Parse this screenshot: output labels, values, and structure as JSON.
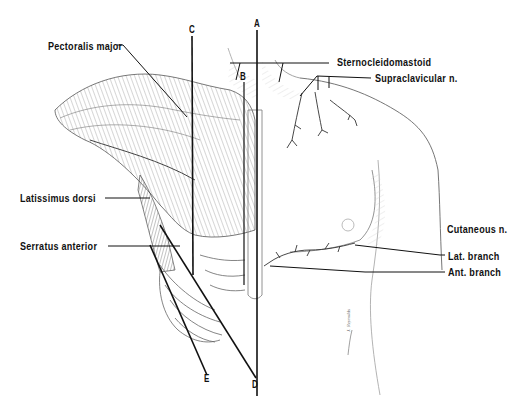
{
  "figure": {
    "background": "#ffffff",
    "ink_color": "#111111",
    "shading_color": "#9a9a9a"
  },
  "labels": {
    "pectoralis_major": "Pectoralis major",
    "latissimus_dorsi": "Latissimus dorsi",
    "serratus_anterior": "Serratus anterior",
    "sternocleidomastoid": "Sternocleidomastoid",
    "supraclavicular_n": "Supraclavicular n.",
    "cutaneous_n": "Cutaneous n.",
    "lat_branch": "Lat. branch",
    "ant_branch": "Ant. branch"
  },
  "reference_lines": {
    "A": "A",
    "B": "B",
    "C": "C",
    "D": "D",
    "E": "E"
  },
  "signature": "J. Reynolds"
}
